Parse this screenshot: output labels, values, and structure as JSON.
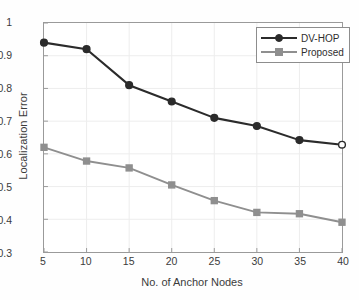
{
  "chart_data": {
    "type": "line",
    "title": "",
    "xlabel": "No. of Anchor Nodes",
    "ylabel": "Localization Error",
    "x": [
      5,
      10,
      15,
      20,
      25,
      30,
      35,
      40
    ],
    "xlim": [
      5,
      40
    ],
    "ylim": [
      0.3,
      1
    ],
    "xticks": [
      "5",
      "10",
      "15",
      "20",
      "25",
      "30",
      "35",
      "40"
    ],
    "yticks": [
      "0.3",
      "0.4",
      "0.5",
      "0.6",
      "0.7",
      "0.8",
      "0.9",
      "1"
    ],
    "grid": true,
    "legend_position": "upper right",
    "series": [
      {
        "name": "DV-HOP",
        "color": "#2b2b2b",
        "marker": "circle",
        "values": [
          0.94,
          0.92,
          0.81,
          0.76,
          0.71,
          0.685,
          0.642,
          0.628
        ]
      },
      {
        "name": "Proposed",
        "color": "#8f8f8f",
        "marker": "square",
        "values": [
          0.62,
          0.578,
          0.557,
          0.505,
          0.457,
          0.421,
          0.417,
          0.391
        ]
      }
    ]
  },
  "legend": {
    "items": [
      {
        "label": "DV-HOP"
      },
      {
        "label": "Proposed"
      }
    ]
  },
  "colors": {
    "series_dark": "#2b2b2b",
    "series_gray": "#8f8f8f",
    "axis": "#9a9a9a",
    "grid": "#ededed",
    "background": "#fefefe"
  }
}
